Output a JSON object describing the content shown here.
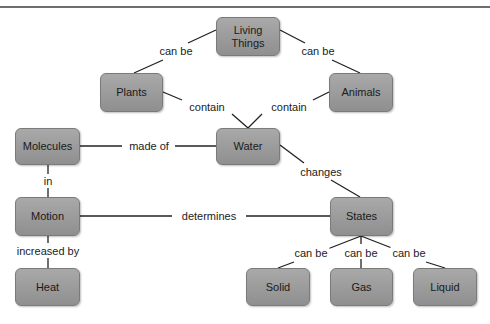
{
  "diagram": {
    "nodes": {
      "living_things": "Living Things",
      "plants": "Plants",
      "animals": "Animals",
      "molecules": "Molecules",
      "water": "Water",
      "motion": "Motion",
      "states": "States",
      "heat": "Heat",
      "solid": "Solid",
      "gas": "Gas",
      "liquid": "Liquid"
    },
    "links": {
      "living_plants": "can be",
      "living_animals": "can be",
      "plants_water": "contain",
      "animals_water": "contain",
      "molecules_water": "made of",
      "water_states": "changes",
      "molecules_motion": "in",
      "motion_states": "determines",
      "motion_heat": "increased by",
      "states_solid": "can be",
      "states_gas": "can be",
      "states_liquid": "can be"
    },
    "colors": {
      "node_fill": "#9c9c9c",
      "node_border": "#7a7a7a",
      "edge": "#222222",
      "background": "#ffffff"
    }
  }
}
